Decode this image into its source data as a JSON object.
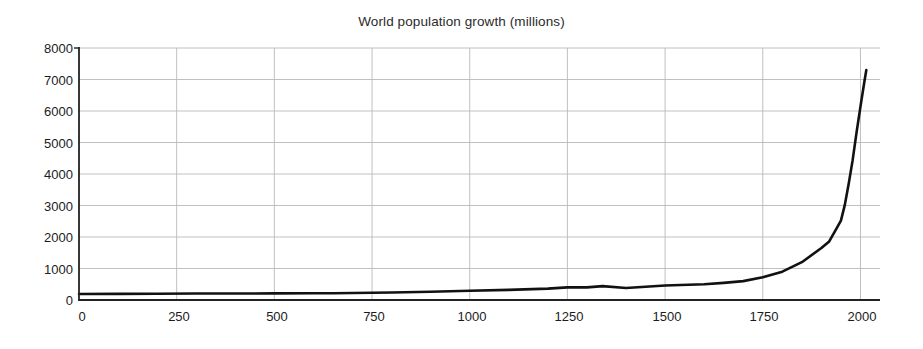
{
  "chart_data": {
    "type": "line",
    "title": "World population growth (millions)",
    "xlabel": "",
    "ylabel": "",
    "xlim": [
      0,
      2050
    ],
    "ylim": [
      0,
      8000
    ],
    "grid": true,
    "legend": null,
    "x_ticks": [
      0,
      250,
      500,
      750,
      1000,
      1250,
      1500,
      1750,
      2000
    ],
    "y_ticks": [
      0,
      1000,
      2000,
      3000,
      4000,
      5000,
      6000,
      7000,
      8000
    ],
    "series": [
      {
        "name": "World population",
        "x": [
          0,
          100,
          200,
          300,
          400,
          500,
          600,
          650,
          700,
          800,
          900,
          1000,
          1100,
          1200,
          1250,
          1300,
          1340,
          1400,
          1500,
          1600,
          1650,
          1700,
          1750,
          1800,
          1850,
          1900,
          1920,
          1940,
          1950,
          1960,
          1970,
          1980,
          1990,
          2000,
          2010,
          2015
        ],
        "y": [
          190,
          195,
          200,
          205,
          206,
          210,
          215,
          215,
          220,
          240,
          260,
          295,
          320,
          360,
          400,
          400,
          440,
          380,
          460,
          500,
          545,
          600,
          720,
          900,
          1200,
          1650,
          1860,
          2300,
          2520,
          3020,
          3700,
          4440,
          5320,
          6140,
          6930,
          7300
        ]
      }
    ],
    "annotations": {
      "curve_color": "#111111",
      "grid_color": "#b9b9b9",
      "axis_color": "#222222",
      "background": "#ffffff"
    }
  },
  "axes": {
    "y_tick_labels": [
      "8000",
      "7000",
      "6000",
      "5000",
      "4000",
      "3000",
      "2000",
      "1000",
      "0"
    ],
    "x_tick_labels": [
      "0",
      "250",
      "500",
      "750",
      "1000",
      "1250",
      "1500",
      "1750",
      "2000"
    ]
  }
}
